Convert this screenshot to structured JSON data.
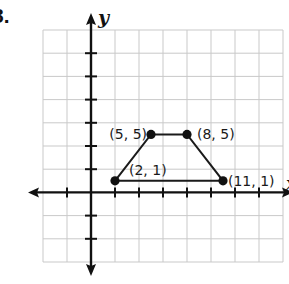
{
  "problem_number": "8.",
  "axes": {
    "x_label": "x",
    "y_label": "y"
  },
  "chart_data": {
    "type": "line",
    "title": "",
    "xlabel": "x",
    "ylabel": "y",
    "shape": "closed polygon (trapezoid)",
    "points": [
      {
        "label": "(2, 1)",
        "x": 2,
        "y": 1,
        "label_position": "above-right"
      },
      {
        "label": "(5, 5)",
        "x": 5,
        "y": 5,
        "label_position": "left"
      },
      {
        "label": "(8, 5)",
        "x": 8,
        "y": 5,
        "label_position": "right"
      },
      {
        "label": "(11, 1)",
        "x": 11,
        "y": 1,
        "label_position": "right"
      }
    ],
    "x_range": [
      -4,
      16
    ],
    "y_range": [
      -6,
      14
    ],
    "grid": true,
    "grid_step": 2,
    "x_ticks": [
      -2,
      2,
      4,
      6,
      8,
      10,
      12,
      14
    ],
    "y_ticks": [
      -4,
      -2,
      2,
      4,
      6,
      8,
      10,
      12
    ],
    "tick_labels_shown": false
  }
}
